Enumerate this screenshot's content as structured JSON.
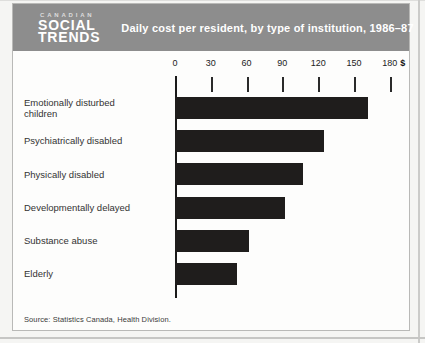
{
  "header": {
    "logo": {
      "kicker": "CANADIAN",
      "line1": "SOCIAL",
      "line2": "TRENDS"
    },
    "title": "Daily cost per resident, by type of institution, 1986–87"
  },
  "chart_data": {
    "type": "bar",
    "orientation": "horizontal",
    "title": "Daily cost per resident, by type of institution, 1986–87",
    "categories": [
      "Emotionally disturbed children",
      "Psychiatrically disabled",
      "Physically disabled",
      "Developmentally delayed",
      "Substance abuse",
      "Elderly"
    ],
    "values": [
      162,
      125,
      107,
      92,
      62,
      52
    ],
    "unit": "$",
    "xlabel": "",
    "ylabel": "",
    "xlim": [
      0,
      180
    ],
    "axis": {
      "position": "top",
      "ticks": [
        0,
        30,
        60,
        90,
        120,
        150,
        180
      ],
      "unit_label": "$"
    },
    "grid": false,
    "legend": "none",
    "bar_color": "#1f1d1c"
  },
  "footer": {
    "source": "Source: Statistics Canada, Health Division."
  },
  "colors": {
    "header_bg": "#8d8d8d",
    "header_text": "#ffffff",
    "kicker_text": "#dcdcdc",
    "bar": "#1f1d1c",
    "card_bg": "#fdfdfc",
    "card_border": "#b9b9b7",
    "page_bg": "#f5f5f3",
    "axis_text": "#222222"
  }
}
